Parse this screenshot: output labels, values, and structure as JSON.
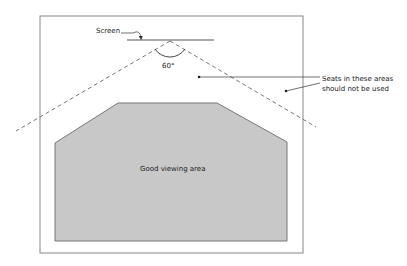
{
  "diagram": {
    "labels": {
      "screen": "Screen",
      "angle": "60°",
      "restricted_line1": "Seats in these areas",
      "restricted_line2": "should not be used",
      "good_area": "Good viewing area"
    },
    "colors": {
      "room_border": "#888888",
      "good_area_fill": "#c8c8c8",
      "good_area_stroke": "#777777",
      "dashed_lines": "#666666",
      "text": "#222222"
    },
    "room": {
      "x": 40,
      "y": 16,
      "width": 263,
      "height": 237
    },
    "screen_line": {
      "x1": 127,
      "y1": 40,
      "x2": 214,
      "y2": 40
    },
    "viewing_angle_deg": 60,
    "good_area_polygon": [
      [
        55,
        143
      ],
      [
        118,
        103
      ],
      [
        217,
        103
      ],
      [
        287,
        142
      ],
      [
        287,
        241
      ],
      [
        55,
        241
      ]
    ]
  }
}
